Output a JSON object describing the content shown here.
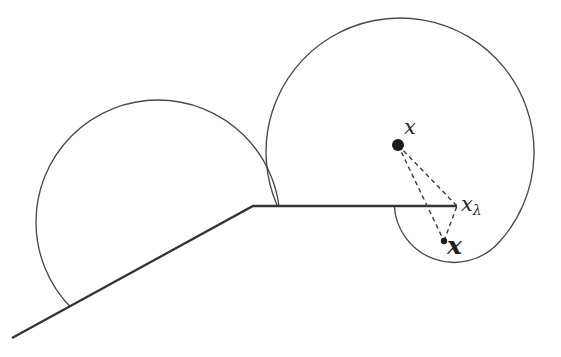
{
  "figure": {
    "background_color": "#ffffff",
    "boundary_color": "#333333",
    "circle_color": "#4a4a4a",
    "dash_color": "#3c3c3c",
    "dot_color": "#1c1c1c",
    "labels": {
      "point_x": "x",
      "prox_base": "x",
      "prox_sub": "λ",
      "projection": "x"
    },
    "geometry": {
      "boundary_path": "M 12 338 L 253 206 L 457 206",
      "left_circle": {
        "cx": 158,
        "cy": 222,
        "r": 122
      },
      "right_blob_path": "M 277.4 206 A 134 134 0 1 1 498.1 243.3 A 60 60 0 0 1 394.3 206",
      "dash_x_xlambda": {
        "x1": 398,
        "y1": 145,
        "x2": 457,
        "y2": 206
      },
      "dash_x_proj": {
        "x1": 398,
        "y1": 145,
        "x2": 444,
        "y2": 241
      },
      "dash_proj_xlambda": {
        "x1": 444,
        "y1": 241,
        "x2": 457,
        "y2": 206
      },
      "dot_x": {
        "cx": 398,
        "cy": 145,
        "r": 6
      },
      "dot_proj": {
        "cx": 444,
        "cy": 241,
        "r": 3.2
      },
      "label_x_pos": {
        "x": 410,
        "y": 134
      },
      "label_xlambda_pos": {
        "x": 461,
        "y": 211
      },
      "label_proj_pos": {
        "x": 447,
        "y": 254
      }
    }
  }
}
